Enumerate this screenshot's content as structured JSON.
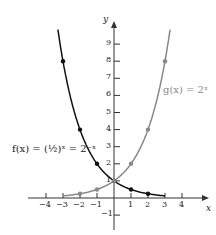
{
  "chart_data": {
    "type": "line",
    "title": "",
    "xlabel": "x",
    "ylabel": "y",
    "xlim": [
      -4.5,
      4.8
    ],
    "ylim": [
      -1.8,
      10.5
    ],
    "x_ticks": [
      -4,
      -3,
      -2,
      -1,
      1,
      2,
      3,
      4
    ],
    "y_ticks": [
      -1,
      1,
      2,
      3,
      4,
      5,
      6,
      7,
      8,
      9
    ],
    "grid": false,
    "series": [
      {
        "name": "f(x) = (1/2)^x = 2^-x",
        "color": "#111111",
        "points": [
          [
            -3,
            8
          ],
          [
            -2,
            4
          ],
          [
            -1,
            2
          ],
          [
            0,
            1
          ],
          [
            1,
            0.5
          ],
          [
            2,
            0.25
          ],
          [
            3,
            0.125
          ]
        ]
      },
      {
        "name": "g(x) = 2^x",
        "color": "#888888",
        "points": [
          [
            -3,
            0.125
          ],
          [
            -2,
            0.25
          ],
          [
            -1,
            0.5
          ],
          [
            0,
            1
          ],
          [
            1,
            2
          ],
          [
            2,
            4
          ],
          [
            3,
            8
          ]
        ]
      }
    ],
    "annotations": [
      "f(x) = (1/2)^x = 2^-x",
      "g(x) = 2^x"
    ]
  },
  "labels": {
    "x_axis": "x",
    "y_axis": "y",
    "f_label": "f(x) = (½)ˣ = 2⁻ˣ",
    "g_label": "g(x) = 2ˣ"
  }
}
